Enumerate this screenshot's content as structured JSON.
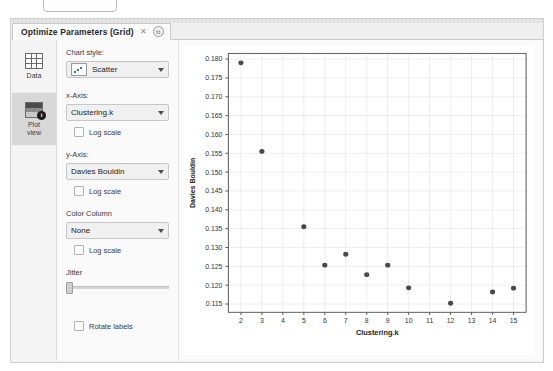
{
  "window": {
    "tab_label": "Optimize Parameters (Grid)",
    "close_icon": "close-icon",
    "detach_icon": "detach-icon",
    "detach_glyph": "⧉"
  },
  "sidebar": {
    "items": [
      {
        "label": "Data",
        "icon": "table-icon",
        "active": false
      },
      {
        "label": "Plot\nview",
        "label_line1": "Plot",
        "label_line2": "view",
        "icon": "plot-icon",
        "active": true,
        "badge": "i"
      }
    ]
  },
  "controls": {
    "chart_style": {
      "label": "Chart style:",
      "value": "Scatter",
      "icon": "scatter-chart-icon"
    },
    "x_axis": {
      "label": "x-Axis:",
      "value": "Clustering.k"
    },
    "x_log": {
      "label": "Log scale",
      "checked": false
    },
    "y_axis": {
      "label": "y-Axis:",
      "value": "Davies Bouldin"
    },
    "y_log": {
      "label": "Log scale",
      "checked": false
    },
    "color_column": {
      "label": "Color Column",
      "value": "None"
    },
    "color_log": {
      "label": "Log scale",
      "checked": false
    },
    "jitter": {
      "label": "Jitter",
      "value": 0
    },
    "rotate_labels": {
      "label": "Rotate labels",
      "checked": false
    }
  },
  "chart_data": {
    "type": "scatter",
    "title": "",
    "xlabel": "Clustering.k",
    "ylabel": "Davies Bouldin",
    "xlim": [
      1.4,
      15.6
    ],
    "ylim": [
      0.1128,
      0.1815
    ],
    "xticks": [
      2,
      3,
      4,
      5,
      6,
      7,
      8,
      9,
      10,
      11,
      12,
      13,
      14,
      15
    ],
    "yticks": [
      0.115,
      0.12,
      0.125,
      0.13,
      0.135,
      0.14,
      0.145,
      0.15,
      0.155,
      0.16,
      0.165,
      0.17,
      0.175,
      0.18
    ],
    "ytick_labels": [
      "0.115",
      "0.120",
      "0.125",
      "0.130",
      "0.135",
      "0.140",
      "0.145",
      "0.150",
      "0.155",
      "0.160",
      "0.165",
      "0.170",
      "0.175",
      "0.180"
    ],
    "grid": true,
    "legend": false,
    "point_color": "#4a4a4a",
    "points": [
      {
        "x": 2,
        "y": 0.179
      },
      {
        "x": 3,
        "y": 0.1555
      },
      {
        "x": 5,
        "y": 0.1355
      },
      {
        "x": 6,
        "y": 0.1253
      },
      {
        "x": 7,
        "y": 0.1282
      },
      {
        "x": 8,
        "y": 0.1228
      },
      {
        "x": 9,
        "y": 0.1253
      },
      {
        "x": 10,
        "y": 0.1193
      },
      {
        "x": 12,
        "y": 0.1152
      },
      {
        "x": 14,
        "y": 0.1182
      },
      {
        "x": 15,
        "y": 0.1192
      }
    ]
  }
}
